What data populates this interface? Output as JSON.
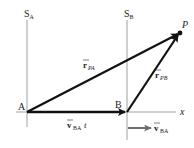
{
  "diagram": {
    "frames": [
      {
        "name": "S",
        "subscript": "A"
      },
      {
        "name": "S",
        "subscript": "B"
      }
    ],
    "points": {
      "A": "A",
      "B": "B",
      "P": "P"
    },
    "axis_label": "x",
    "vectors": {
      "r_PA": {
        "base": "r",
        "subscript": "PA"
      },
      "r_PB": {
        "base": "r",
        "subscript": "PB"
      },
      "v_BA_t": {
        "base": "v",
        "subscript": "BA",
        "suffix": "t"
      },
      "v_BA": {
        "base": "v",
        "subscript": "BA"
      }
    },
    "colors": {
      "vector": "#111111",
      "frame_line": "#888888",
      "velocity_arrow": "#6e6e6e"
    }
  }
}
